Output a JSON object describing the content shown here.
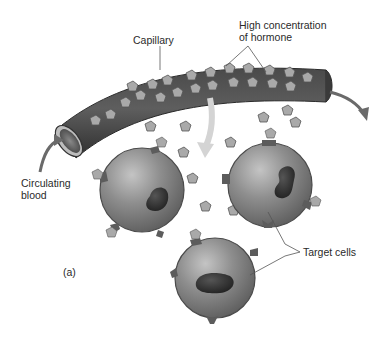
{
  "figure": {
    "panel_label": "(a)",
    "labels": {
      "capillary": "Capillary",
      "high_concentration_line1": "High concentration",
      "high_concentration_line2": "of hormone",
      "circulating_line1": "Circulating",
      "circulating_line2": "blood",
      "target_cells": "Target cells"
    },
    "colors": {
      "background": "#ffffff",
      "vessel_dark": "#3e3e3e",
      "vessel_mid": "#5a5a5a",
      "hormone_fill": "#a9a9a9",
      "cell_fill": "#8a8a8a",
      "cell_light": "#b8b8b8",
      "nucleus": "#2e2e2e",
      "receptor": "#5c5c5c",
      "diffusion_arrow": "#d4d4d4",
      "flow_arrow": "#6a6a6a",
      "leader_line": "#555555"
    },
    "cells": [
      {
        "name": "target-cell-left",
        "cx": 142,
        "cy": 190,
        "r": 42
      },
      {
        "name": "target-cell-right",
        "cx": 270,
        "cy": 185,
        "r": 42
      },
      {
        "name": "target-cell-bottom",
        "cx": 215,
        "cy": 278,
        "r": 40
      }
    ]
  }
}
